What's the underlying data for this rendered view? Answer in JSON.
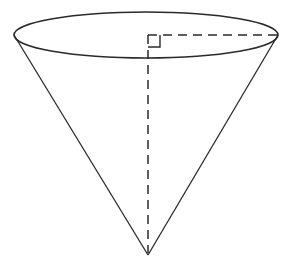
{
  "figure": {
    "type": "geometry-diagram",
    "shape": "inverted-right-circular-cone",
    "stroke_color": "#2a2a2a",
    "background": "#ffffff",
    "base_ellipse": {
      "cx": 146,
      "cy": 35,
      "rx": 132,
      "ry": 23
    },
    "apex": {
      "x": 148,
      "y": 255
    },
    "left_rim": {
      "x": 14,
      "y": 35
    },
    "right_rim": {
      "x": 278,
      "y": 35
    },
    "height_segment": {
      "style": "dashed",
      "from": "base-center",
      "to": "apex"
    },
    "radius_segment": {
      "style": "dashed",
      "from": "base-center",
      "to": "right-rim"
    },
    "right_angle_marker": true,
    "labels": []
  }
}
